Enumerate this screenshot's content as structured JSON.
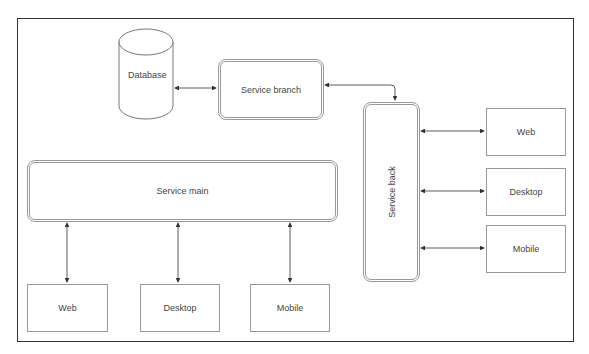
{
  "diagram": {
    "database": {
      "label": "Database"
    },
    "service_branch": {
      "label": "Service branch"
    },
    "service_back": {
      "label": "Service back"
    },
    "service_main": {
      "label": "Service main"
    },
    "back_clients": [
      {
        "label": "Web"
      },
      {
        "label": "Desktop"
      },
      {
        "label": "Mobile"
      }
    ],
    "main_clients": [
      {
        "label": "Web"
      },
      {
        "label": "Desktop"
      },
      {
        "label": "Mobile"
      }
    ],
    "connections": [
      "Database <-> Service branch",
      "Service branch <-> Service back",
      "Service back <-> Web",
      "Service back <-> Desktop",
      "Service back <-> Mobile",
      "Service main <-> Web",
      "Service main <-> Desktop",
      "Service main <-> Mobile"
    ],
    "colors": {
      "frame": "#333333",
      "box_border": "#999999",
      "line": "#333333"
    }
  }
}
